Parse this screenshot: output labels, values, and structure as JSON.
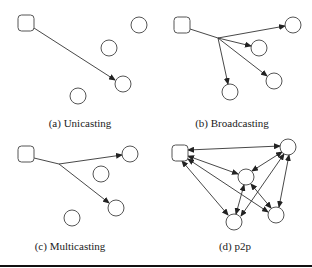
{
  "figure": {
    "panels": [
      {
        "id": "a",
        "caption": "(a) Unicasting",
        "caption_pos": [
          80,
          117
        ],
        "source": {
          "x": 18,
          "y": 15,
          "w": 16,
          "h": 16
        },
        "nodes": [
          [
            139,
            25
          ],
          [
            109,
            48
          ],
          [
            123,
            84
          ],
          [
            78,
            96
          ]
        ],
        "edges": [
          {
            "path": [
              [
                34,
                28
              ],
              [
                115,
                80
              ]
            ],
            "arrow_end": true,
            "arrow_start": false
          }
        ]
      },
      {
        "id": "b",
        "caption": "(b) Broadcasting",
        "caption_pos": [
          232,
          117
        ],
        "source": {
          "x": 174,
          "y": 17,
          "w": 16,
          "h": 16
        },
        "nodes": [
          [
            293,
            25
          ],
          [
            259,
            48
          ],
          [
            274,
            81
          ],
          [
            230,
            92
          ]
        ],
        "junction": [
          218,
          38
        ],
        "edges": [
          {
            "path": [
              [
                190,
                29
              ],
              [
                218,
                38
              ]
            ],
            "arrow_end": false,
            "arrow_start": false
          },
          {
            "path": [
              [
                218,
                38
              ],
              [
                285,
                26
              ]
            ],
            "arrow_end": true,
            "arrow_start": false
          },
          {
            "path": [
              [
                218,
                38
              ],
              [
                251,
                46
              ]
            ],
            "arrow_end": true,
            "arrow_start": false
          },
          {
            "path": [
              [
                218,
                38
              ],
              [
                267,
                76
              ]
            ],
            "arrow_end": true,
            "arrow_start": false
          },
          {
            "path": [
              [
                218,
                38
              ],
              [
                228,
                84
              ]
            ],
            "arrow_end": true,
            "arrow_start": false
          }
        ]
      },
      {
        "id": "c",
        "caption": "(c) Multicasting",
        "caption_pos": [
          70,
          240
        ],
        "source": {
          "x": 18,
          "y": 146,
          "w": 16,
          "h": 16
        },
        "nodes": [
          [
            130,
            154
          ],
          [
            101,
            174
          ],
          [
            116,
            208
          ],
          [
            72,
            218
          ]
        ],
        "junction": [
          59,
          164
        ],
        "edges": [
          {
            "path": [
              [
                34,
                158
              ],
              [
                59,
                164
              ]
            ],
            "arrow_end": false,
            "arrow_start": false
          },
          {
            "path": [
              [
                59,
                164
              ],
              [
                122,
                155
              ]
            ],
            "arrow_end": true,
            "arrow_start": false
          },
          {
            "path": [
              [
                59,
                164
              ],
              [
                109,
                203
              ]
            ],
            "arrow_end": true,
            "arrow_start": false
          }
        ]
      },
      {
        "id": "d",
        "caption": "(d) p2p",
        "caption_pos": [
          235,
          240
        ],
        "source": {
          "x": 172,
          "y": 145,
          "w": 16,
          "h": 16
        },
        "nodes": [
          [
            288,
            147
          ],
          [
            246,
            177
          ],
          [
            234,
            222
          ],
          [
            276,
            215
          ]
        ],
        "edges": [
          {
            "path": [
              [
                188,
                150
              ],
              [
                280,
                146
              ]
            ],
            "arrow_end": true,
            "arrow_start": true
          },
          {
            "path": [
              [
                188,
                156
              ],
              [
                238,
                174
              ]
            ],
            "arrow_end": true,
            "arrow_start": true
          },
          {
            "path": [
              [
                182,
                161
              ],
              [
                228,
                215
              ]
            ],
            "arrow_end": true,
            "arrow_start": true
          },
          {
            "path": [
              [
                188,
                159
              ],
              [
                268,
                212
              ]
            ],
            "arrow_end": true,
            "arrow_start": true
          },
          {
            "path": [
              [
                252,
                171
              ],
              [
                282,
                152
              ]
            ],
            "arrow_end": true,
            "arrow_start": true
          },
          {
            "path": [
              [
                244,
                185
              ],
              [
                236,
                214
              ]
            ],
            "arrow_end": true,
            "arrow_start": true
          },
          {
            "path": [
              [
                251,
                184
              ],
              [
                271,
                208
              ]
            ],
            "arrow_end": true,
            "arrow_start": true
          },
          {
            "path": [
              [
                241,
                216
              ],
              [
                284,
                154
              ]
            ],
            "arrow_end": true,
            "arrow_start": true
          },
          {
            "path": [
              [
                289,
                155
              ],
              [
                279,
                207
              ]
            ],
            "arrow_end": true,
            "arrow_start": true
          }
        ]
      }
    ],
    "node_radius": 8,
    "stroke_color": "#555555",
    "edge_color": "#333333"
  }
}
